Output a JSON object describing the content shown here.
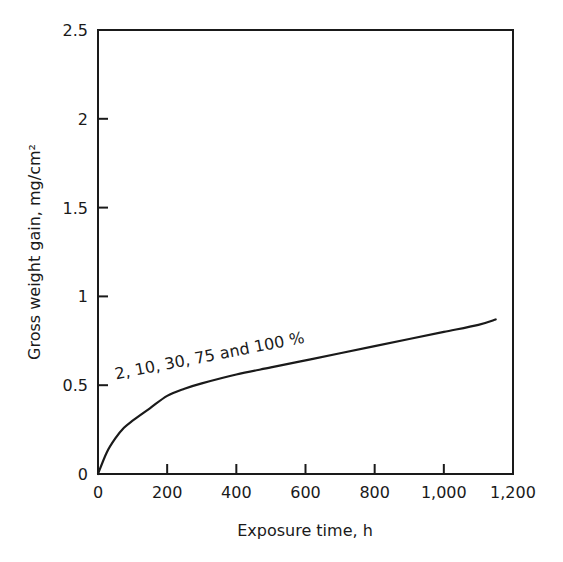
{
  "chart_data": {
    "type": "line",
    "title": "",
    "xlabel": "Exposure time, h",
    "ylabel": "Gross weight gain, mg/cm²",
    "xlim": [
      0,
      1200
    ],
    "ylim": [
      0,
      2.5
    ],
    "grid": false,
    "legend": null,
    "x_ticks": [
      0,
      200,
      400,
      600,
      800,
      1000,
      1200
    ],
    "x_tick_labels": [
      "0",
      "200",
      "400",
      "600",
      "800",
      "1,000",
      "1,200"
    ],
    "y_ticks": [
      0,
      0.5,
      1,
      1.5,
      2,
      2.5
    ],
    "y_tick_labels": [
      "0",
      "0.5",
      "1",
      "1.5",
      "2",
      "2.5"
    ],
    "series": [
      {
        "name": "2, 10, 30, 75 and 100 %",
        "x": [
          0,
          25,
          50,
          75,
          100,
          150,
          200,
          250,
          300,
          400,
          500,
          600,
          700,
          800,
          900,
          1000,
          1100,
          1150
        ],
        "y": [
          0,
          0.12,
          0.2,
          0.26,
          0.3,
          0.37,
          0.44,
          0.48,
          0.51,
          0.56,
          0.6,
          0.64,
          0.68,
          0.72,
          0.76,
          0.8,
          0.84,
          0.87
        ]
      }
    ],
    "annotations": [
      {
        "text": "2, 10, 30, 75 and 100 %",
        "x": 260,
        "y": 0.6,
        "rotation_deg": -11
      }
    ],
    "line_color": "#1a1a1a"
  }
}
